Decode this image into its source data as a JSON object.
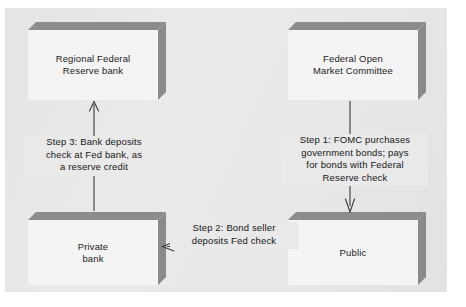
{
  "diagram": {
    "background_color": "#e9e9e9",
    "box_face_color": "#f4f4f4",
    "box_bevel_color": "#8c8c8c",
    "arrow_color": "#3b3b3b"
  },
  "boxes": [
    {
      "id": "regional-federal-reserve-bank",
      "label": "Regional Federal\nReserve bank",
      "position": "top-left"
    },
    {
      "id": "federal-open-market-committee",
      "label": "Federal  Open\nMarket Committee",
      "position": "top-right"
    },
    {
      "id": "private-bank",
      "label": "Private\nbank",
      "position": "bottom-left"
    },
    {
      "id": "public",
      "label": "Public",
      "position": "bottom-right"
    }
  ],
  "steps": [
    {
      "id": "step-1",
      "label": "Step 1: FOMC purchases\ngovernment bonds; pays\nfor bonds with Federal\nReserve check",
      "from": "federal-open-market-committee",
      "to": "public",
      "direction": "down"
    },
    {
      "id": "step-2",
      "label": "Step 2: Bond seller\ndeposits Fed check",
      "from": "public",
      "to": "private-bank",
      "direction": "left"
    },
    {
      "id": "step-3",
      "label": "Step 3: Bank deposits\ncheck at Fed bank, as\na reserve credit",
      "from": "private-bank",
      "to": "regional-federal-reserve-bank",
      "direction": "up"
    }
  ]
}
